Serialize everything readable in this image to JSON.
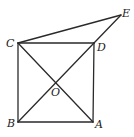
{
  "diagram": {
    "type": "geometry",
    "points": {
      "A": {
        "label": "A",
        "x": 93,
        "y": 122
      },
      "B": {
        "label": "B",
        "x": 18,
        "y": 122
      },
      "C": {
        "label": "C",
        "x": 18,
        "y": 43
      },
      "D": {
        "label": "D",
        "x": 94,
        "y": 43
      },
      "E": {
        "label": "E",
        "x": 121,
        "y": 15
      },
      "O": {
        "label": "O",
        "x": 56,
        "y": 83
      }
    },
    "segments": [
      "CD",
      "DA",
      "AB",
      "BC",
      "CA",
      "BD",
      "CE",
      "DE"
    ],
    "colors": {
      "line": "#2a2a2a",
      "label": "#222222",
      "background": "#ffffff"
    }
  }
}
